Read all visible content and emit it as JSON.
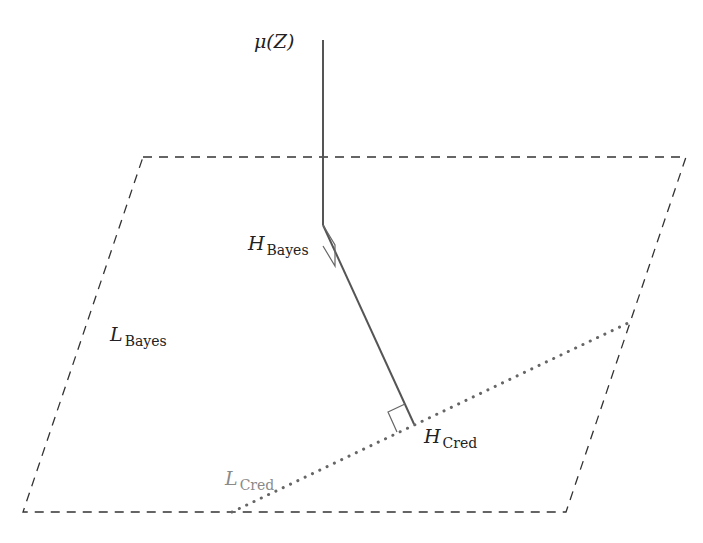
{
  "diagram": {
    "type": "geometric-projection",
    "colors": {
      "plane_edge": "#333333",
      "projection_line": "#555555",
      "cred_line": "#666666",
      "label": "#222222",
      "cred_label": "#8a8a8a"
    },
    "labels": {
      "mu": {
        "main": "μ(Z)",
        "sub": ""
      },
      "h_bayes": {
        "main": "H",
        "sub": "Bayes"
      },
      "l_bayes": {
        "main": "L",
        "sub": "Bayes"
      },
      "h_cred": {
        "main": "H",
        "sub": "Cred"
      },
      "l_cred": {
        "main": "L",
        "sub": "Cred"
      }
    },
    "points": {
      "mu_top": [
        323,
        40
      ],
      "h_bayes": [
        323,
        225
      ],
      "h_cred": [
        414,
        424
      ]
    },
    "plane_L_Bayes": [
      [
        143,
        157
      ],
      [
        686,
        157
      ],
      [
        566,
        512
      ],
      [
        23,
        512
      ]
    ],
    "line_L_Cred": [
      [
        232,
        512
      ],
      [
        628,
        323
      ]
    ]
  }
}
